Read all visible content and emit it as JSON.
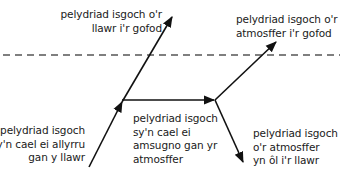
{
  "diagram": {
    "type": "infrared radiation energy flow",
    "boundary": {
      "style": "dashed",
      "meaning": "top of atmosphere"
    },
    "labels": {
      "ground_to_space": [
        "pelydriad isgoch o'r",
        "llawr i'r gofod"
      ],
      "atmosphere_to_space": [
        "pelydriad isgoch o'r",
        "atmosffer i'r gofod"
      ],
      "emitted_by_ground": [
        "pelydriad isgoch",
        "sy'n cael ei allyrru",
        "gan y llawr"
      ],
      "absorbed_by_atmosphere": [
        "pelydriad isgoch",
        "sy'n cael ei",
        "amsugno gan yr",
        "atmosffer"
      ],
      "atmosphere_back_to_ground": [
        "pelydriad isgoch",
        "o'r atmosffer",
        "yn ôl i'r llawr"
      ]
    },
    "colors": {
      "line": "#111111",
      "dash": "#555555",
      "text": "#1a1a1a",
      "background": "#ffffff"
    }
  }
}
